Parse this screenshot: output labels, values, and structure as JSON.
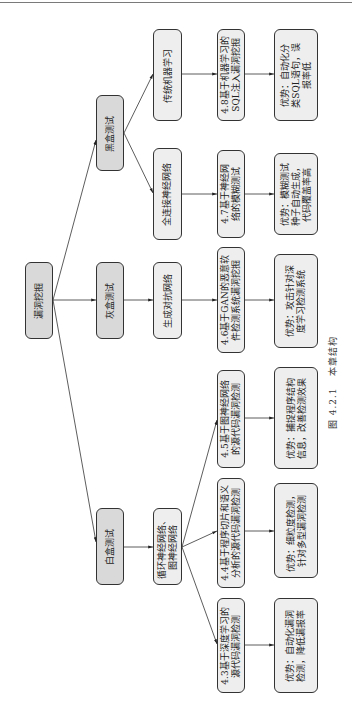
{
  "diagram": {
    "root": {
      "label": "漏洞挖掘"
    },
    "level1": [
      {
        "label": "黑盒测试"
      },
      {
        "label": "灰盒测试"
      },
      {
        "label": "白盒测试"
      }
    ],
    "level2": [
      {
        "label": "传统机器学习"
      },
      {
        "label": "全连接神经网络"
      },
      {
        "label": "生成对抗网络"
      },
      {
        "label": "循环神经网络、\n图神经网络"
      }
    ],
    "sections": [
      {
        "label": "4.8基于机器学习的\nSQL注入漏洞挖掘"
      },
      {
        "label": "4.7基于神经网\n络的模糊测试"
      },
      {
        "label": "4.6基于GAN的恶意软\n件检测系统漏洞挖掘"
      },
      {
        "label": "4.5基于图神经网络\n的源代码漏洞检测"
      },
      {
        "label": "4.4基于程序切片和语义\n分析的源代码漏洞检测"
      },
      {
        "label": "4.3基于深度学习的\n源代码漏洞检测"
      }
    ],
    "advantages": [
      {
        "label": "优势：自动化分\n类SQL语句，误\n报率低"
      },
      {
        "label": "优势：模糊测试\n种子自动生成，\n代码覆盖率高"
      },
      {
        "label": "优势：攻击针对深\n度学习检测系统"
      },
      {
        "label": "优势：捕捉程序结构\n信息，改善检测效果"
      },
      {
        "label": "优势：细粒度检测，\n针对多型漏洞检测"
      },
      {
        "label": "优势：自动化漏洞\n检测，降低漏报率"
      }
    ],
    "caption": "图 4.2.1   本章结构"
  },
  "colors": {
    "level_node_fill": "#d9d9d9",
    "leaf_node_fill": "#eeeeee",
    "border": "#333333"
  }
}
